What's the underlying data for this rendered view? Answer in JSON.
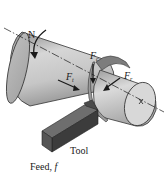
{
  "diagram": {
    "type": "turning-operation-forces",
    "labels": {
      "rotation": "N",
      "cutting_force": {
        "base": "F",
        "sub": "c"
      },
      "thrust_force": {
        "base": "F",
        "sub": "t"
      },
      "radial_force": {
        "base": "F",
        "sub": "r"
      },
      "tool": "Tool",
      "feed": "Feed, ",
      "feed_symbol": "f"
    },
    "colors": {
      "workpiece_light": "#e4e4e4",
      "workpiece_mid": "#bdbdbd",
      "workpiece_dark": "#8e8e8e",
      "tool_top": "#6e6e6e",
      "tool_side": "#3c3c3c",
      "tool_end": "#555555",
      "chip": "#9a9a9a",
      "line": "#1a1a1a"
    }
  }
}
